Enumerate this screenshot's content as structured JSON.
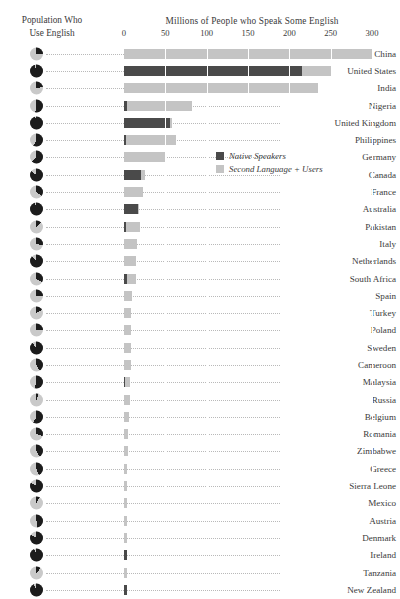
{
  "header": {
    "axis_title": "Millions of People who Speak Some English",
    "corner_title_line1": "Population Who",
    "corner_title_line2": "Use English"
  },
  "legend": {
    "position": "inside-right",
    "items": [
      {
        "label": "Native Speakers",
        "color": "#4a4a4a"
      },
      {
        "label": "Second Language + Users",
        "color": "#c4c4c4"
      }
    ]
  },
  "colors": {
    "native": "#4a4a4a",
    "second": "#c4c4c4",
    "pie_used": "#1c1c1c",
    "pie_rest": "#c9c9c9",
    "text": "#3a3a3a",
    "background": "#ffffff"
  },
  "chart_data": {
    "type": "bar",
    "orientation": "horizontal",
    "stacked": true,
    "title": "Millions of People who Speak Some English",
    "subtitle": "Population Who Use English",
    "xlabel": "Millions of People who Speak Some English",
    "ylabel": "",
    "xlim": [
      0,
      300
    ],
    "xticks": [
      0,
      50,
      100,
      150,
      200,
      250,
      300
    ],
    "xticklabels": [
      "0",
      "50",
      "100",
      "150",
      "200",
      "250",
      "300"
    ],
    "grid": "vertical-white-separators",
    "units": "millions of people",
    "categories": [
      "China",
      "United States",
      "India",
      "Nigeria",
      "United Kingdom",
      "Philippines",
      "Germany",
      "Canada",
      "France",
      "Australia",
      "Pakistan",
      "Italy",
      "Netherlands",
      "South Africa",
      "Spain",
      "Turkey",
      "Poland",
      "Sweden",
      "Cameroon",
      "Malaysia",
      "Russia",
      "Belgium",
      "Romania",
      "Zimbabwe",
      "Greece",
      "Sierra Leone",
      "Mexico",
      "Austria",
      "Denmark",
      "Ireland",
      "Tanzania",
      "New Zealand"
    ],
    "series": [
      {
        "name": "Native Speakers",
        "color": "#4a4a4a",
        "values": [
          0,
          215,
          0,
          4,
          56,
          3,
          0,
          20,
          0,
          17,
          2,
          0,
          0,
          4,
          0,
          0,
          0,
          0,
          0,
          1,
          0,
          0,
          0,
          0,
          0,
          0,
          0,
          0,
          0,
          4,
          0,
          4
        ]
      },
      {
        "name": "Second Language + Users",
        "color": "#c4c4c4",
        "values": [
          300,
          35,
          235,
          78,
          2,
          60,
          50,
          5,
          23,
          1,
          17,
          16,
          15,
          11,
          10,
          9,
          9,
          8,
          8,
          6,
          7,
          6,
          5,
          5,
          4,
          4,
          4,
          4,
          4,
          0,
          4,
          0
        ]
      }
    ],
    "totals": [
      300,
      250,
      235,
      82,
      58,
      63,
      50,
      25,
      23,
      18,
      19,
      16,
      15,
      15,
      10,
      9,
      9,
      8,
      8,
      7,
      7,
      6,
      5,
      5,
      4,
      4,
      4,
      4,
      4,
      4,
      4,
      4
    ]
  },
  "rows": [
    {
      "country": "China",
      "native": 0,
      "second": 300,
      "pie_pct": 25
    },
    {
      "country": "United States",
      "native": 215,
      "second": 35,
      "pie_pct": 95
    },
    {
      "country": "India",
      "native": 0,
      "second": 235,
      "pie_pct": 23
    },
    {
      "country": "Nigeria",
      "native": 4,
      "second": 78,
      "pie_pct": 53
    },
    {
      "country": "United Kingdom",
      "native": 56,
      "second": 2,
      "pie_pct": 97
    },
    {
      "country": "Philippines",
      "native": 3,
      "second": 60,
      "pie_pct": 58
    },
    {
      "country": "Germany",
      "native": 0,
      "second": 50,
      "pie_pct": 62
    },
    {
      "country": "Canada",
      "native": 20,
      "second": 5,
      "pie_pct": 85
    },
    {
      "country": "France",
      "native": 0,
      "second": 23,
      "pie_pct": 36
    },
    {
      "country": "Australia",
      "native": 17,
      "second": 1,
      "pie_pct": 96
    },
    {
      "country": "Pakistan",
      "native": 2,
      "second": 17,
      "pie_pct": 12
    },
    {
      "country": "Italy",
      "native": 0,
      "second": 16,
      "pie_pct": 28
    },
    {
      "country": "Netherlands",
      "native": 0,
      "second": 15,
      "pie_pct": 88
    },
    {
      "country": "South Africa",
      "native": 4,
      "second": 11,
      "pie_pct": 33
    },
    {
      "country": "Spain",
      "native": 0,
      "second": 10,
      "pie_pct": 26
    },
    {
      "country": "Turkey",
      "native": 0,
      "second": 9,
      "pie_pct": 17
    },
    {
      "country": "Poland",
      "native": 0,
      "second": 9,
      "pie_pct": 26
    },
    {
      "country": "Sweden",
      "native": 0,
      "second": 8,
      "pie_pct": 89
    },
    {
      "country": "Cameroon",
      "native": 0,
      "second": 8,
      "pie_pct": 42
    },
    {
      "country": "Malaysia",
      "native": 1,
      "second": 6,
      "pie_pct": 55
    },
    {
      "country": "Russia",
      "native": 0,
      "second": 7,
      "pie_pct": 5
    },
    {
      "country": "Belgium",
      "native": 0,
      "second": 6,
      "pie_pct": 59
    },
    {
      "country": "Romania",
      "native": 0,
      "second": 5,
      "pie_pct": 30
    },
    {
      "country": "Zimbabwe",
      "native": 0,
      "second": 5,
      "pie_pct": 42
    },
    {
      "country": "Greece",
      "native": 0,
      "second": 4,
      "pie_pct": 44
    },
    {
      "country": "Sierra Leone",
      "native": 0,
      "second": 4,
      "pie_pct": 83
    },
    {
      "country": "Mexico",
      "native": 0,
      "second": 4,
      "pie_pct": 8
    },
    {
      "country": "Austria",
      "native": 0,
      "second": 4,
      "pie_pct": 50
    },
    {
      "country": "Denmark",
      "native": 0,
      "second": 4,
      "pie_pct": 83
    },
    {
      "country": "Ireland",
      "native": 4,
      "second": 0,
      "pie_pct": 94
    },
    {
      "country": "Tanzania",
      "native": 0,
      "second": 4,
      "pie_pct": 11
    },
    {
      "country": "New Zealand",
      "native": 4,
      "second": 0,
      "pie_pct": 93
    }
  ]
}
